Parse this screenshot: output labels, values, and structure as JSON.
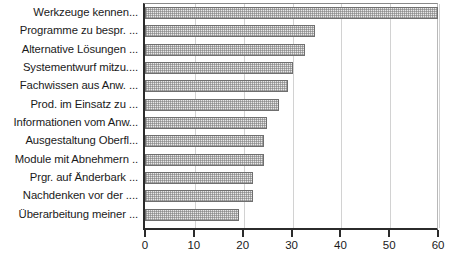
{
  "chart_data": {
    "type": "bar",
    "orientation": "horizontal",
    "title": "",
    "xlabel": "",
    "ylabel": "",
    "xlim": [
      0,
      60
    ],
    "xticks": [
      0,
      10,
      20,
      30,
      40,
      50,
      60
    ],
    "xtick_labels": [
      "0",
      "10",
      "20",
      "30",
      "40",
      "50",
      "60"
    ],
    "grid": true,
    "grid_axis": "x",
    "legend": false,
    "bar_color": "#e8e8e8",
    "bar_edge_color": "#6f6f6f",
    "bar_pattern": "fine-dotted-checker",
    "categories": [
      "Werkzeuge kennen...",
      "Programme zu bespr. ...",
      "Alternative Lösungen ...",
      "Systementwurf mitzu....",
      "Fachwissen aus Anw. ...",
      "Prod. im Einsatz zu ...",
      "Informationen vom Anw...",
      "Ausgestaltung Oberfl...",
      "Module mit Abnehmern ..",
      "Prgr. auf Änderbark ...",
      "Nachdenken vor der  ....",
      "Überarbeitung meiner ..."
    ],
    "values": [
      59.7,
      34.6,
      32.6,
      30.1,
      29.1,
      27.3,
      24.8,
      24.2,
      24.2,
      21.9,
      21.9,
      19.0
    ]
  }
}
